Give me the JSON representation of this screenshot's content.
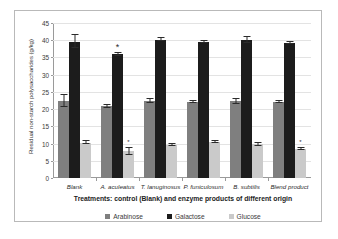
{
  "chart_data": {
    "type": "bar",
    "title": "",
    "xlabel": "Treatments: control  (Blank) and enzyme products of different origin",
    "ylabel": "Residual non-starch polysaccharides (g/kg)",
    "ylim": [
      0,
      45
    ],
    "yticks": [
      0,
      5,
      10,
      15,
      20,
      25,
      30,
      35,
      40,
      45
    ],
    "grid": true,
    "legend_position": "bottom",
    "categories": [
      "Blank",
      "A. aculeatus",
      "T. lanuginosus",
      "P. funiculosum",
      "B. subtilis",
      "Blend product"
    ],
    "series": [
      {
        "name": "Arabinose",
        "color": "#7f7f7f",
        "values": [
          22.3,
          20.8,
          22.4,
          22.2,
          22.3,
          22.1
        ],
        "errors": [
          1.7,
          0.4,
          0.6,
          0.3,
          0.7,
          0.2
        ],
        "significant": [
          false,
          false,
          false,
          false,
          false,
          false
        ]
      },
      {
        "name": "Galactose",
        "color": "#1c1c1c",
        "values": [
          39.6,
          35.9,
          40.2,
          39.4,
          40.1,
          39.2
        ],
        "errors": [
          1.8,
          0.4,
          0.5,
          0.3,
          0.8,
          0.2
        ],
        "significant": [
          false,
          true,
          false,
          false,
          false,
          false
        ]
      },
      {
        "name": "Glucose",
        "color": "#cacaca",
        "values": [
          10.3,
          7.8,
          9.7,
          10.4,
          9.8,
          8.4
        ],
        "errors": [
          0.5,
          1.0,
          0.3,
          0.3,
          0.4,
          0.3
        ],
        "significant": [
          false,
          true,
          false,
          false,
          false,
          true
        ]
      }
    ],
    "annotations": [
      {
        "label": "*",
        "series": "Galactose",
        "category": "A. aculeatus"
      },
      {
        "label": "*",
        "series": "Glucose",
        "category": "A. aculeatus"
      },
      {
        "label": "*",
        "series": "Glucose",
        "category": "Blend product"
      }
    ]
  }
}
